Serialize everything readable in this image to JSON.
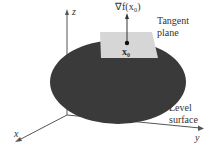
{
  "figure": {
    "axes": {
      "x": "x",
      "y": "y",
      "z": "z"
    },
    "gradient_label": "∇f(x₀)",
    "point_label": "x₀",
    "tangent_plane_label": [
      "Tangent",
      "plane"
    ],
    "surface_label": [
      "Level",
      "surface"
    ]
  },
  "colors": {
    "surface": "#3a3a3a",
    "plane": "#d6d6d6",
    "axis": "#555555"
  }
}
